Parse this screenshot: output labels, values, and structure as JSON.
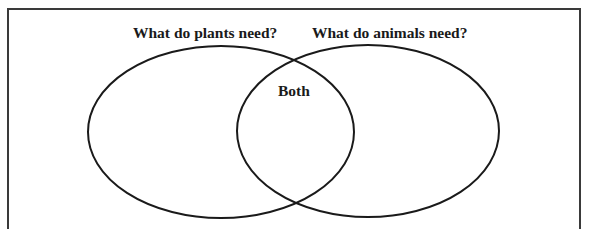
{
  "diagram": {
    "type": "venn",
    "sets": [
      {
        "id": "plants",
        "label": "What do plants need?",
        "contents": []
      },
      {
        "id": "animals",
        "label": "What do animals need?",
        "contents": []
      }
    ],
    "intersection": {
      "label": "Both",
      "contents": []
    },
    "colors": {
      "stroke": "#1a1a1a",
      "frame": "#3a3a3a",
      "background": "#ffffff"
    }
  }
}
